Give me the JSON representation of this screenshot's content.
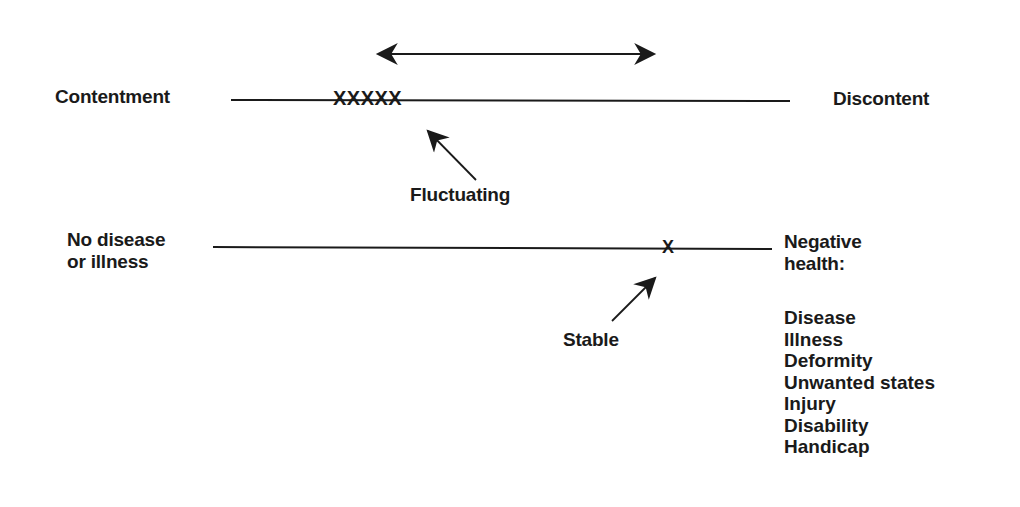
{
  "diagram": {
    "top_scale": {
      "left_label": "Contentment",
      "right_label": "Discontent",
      "marks": "XXXXX",
      "annotation": "Fluctuating",
      "range_arrow": "double-headed-arrow"
    },
    "bottom_scale": {
      "left_label_line1": "No disease",
      "left_label_line2": "or illness",
      "right_label_line1": "Negative",
      "right_label_line2": "health:",
      "marks": "X",
      "annotation": "Stable",
      "negative_health_items": [
        "Disease",
        "Illness",
        "Deformity",
        "Unwanted states",
        "Injury",
        "Disability",
        "Handicap"
      ]
    },
    "colors": {
      "ink": "#1a1a1a",
      "background": "#ffffff"
    }
  }
}
